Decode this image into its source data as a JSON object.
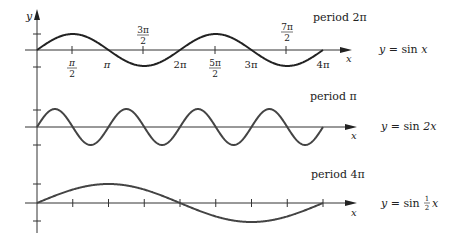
{
  "chart_data": [
    {
      "type": "line",
      "title": "period 2π",
      "equation": "y = sin x",
      "function": "sin(x)",
      "period": "2π",
      "x_range": [
        0,
        12.566
      ],
      "ylim": [
        -1,
        1
      ],
      "xlabel": "x",
      "ylabel": "y",
      "tick_labels": [
        "π/2",
        "π",
        "3π/2",
        "2π",
        "5π/2",
        "3π",
        "7π/2",
        "4π"
      ],
      "points": {
        "x": [
          0,
          1.571,
          3.142,
          4.712,
          6.283,
          7.854,
          9.425,
          10.996,
          12.566
        ],
        "y": [
          0,
          1,
          0,
          -1,
          0,
          1,
          0,
          -1,
          0
        ]
      }
    },
    {
      "type": "line",
      "title": "period π",
      "equation": "y = sin 2x",
      "function": "sin(2x)",
      "period": "π",
      "x_range": [
        0,
        12.566
      ],
      "ylim": [
        -1,
        1
      ],
      "xlabel": "x",
      "points": {
        "x": [
          0,
          0.785,
          1.571,
          2.356,
          3.142
        ],
        "y": [
          0,
          1,
          0,
          -1,
          0
        ]
      }
    },
    {
      "type": "line",
      "title": "period 4π",
      "equation": "y = sin ½x",
      "function": "sin(x/2)",
      "period": "4π",
      "x_range": [
        0,
        12.566
      ],
      "ylim": [
        -1,
        1
      ],
      "xlabel": "x",
      "points": {
        "x": [
          0,
          3.142,
          6.283,
          9.425,
          12.566
        ],
        "y": [
          0,
          1,
          0,
          -1,
          0
        ]
      }
    }
  ],
  "labels": {
    "y_axis": "y",
    "x_axis": "x",
    "graph1": {
      "period": "period 2π",
      "eq_prefix": "y = sin ",
      "eq_var": "x"
    },
    "graph2": {
      "period": "period π",
      "eq_prefix": "y = sin ",
      "eq_var": "2x"
    },
    "graph3": {
      "period": "period 4π",
      "eq_prefix": "y = sin ",
      "eq_frac_num": "1",
      "eq_frac_den": "2",
      "eq_var": "x"
    },
    "ticks": {
      "pi_half_num": "π",
      "pi_half_den": "2",
      "pi": "π",
      "three_pi_half_num": "3π",
      "three_pi_half_den": "2",
      "two_pi": "2π",
      "five_pi_half_num": "5π",
      "five_pi_half_den": "2",
      "three_pi": "3π",
      "seven_pi_half_num": "7π",
      "seven_pi_half_den": "2",
      "four_pi": "4π"
    }
  },
  "colors": {
    "curve": "#222222",
    "axis": "#333333"
  }
}
